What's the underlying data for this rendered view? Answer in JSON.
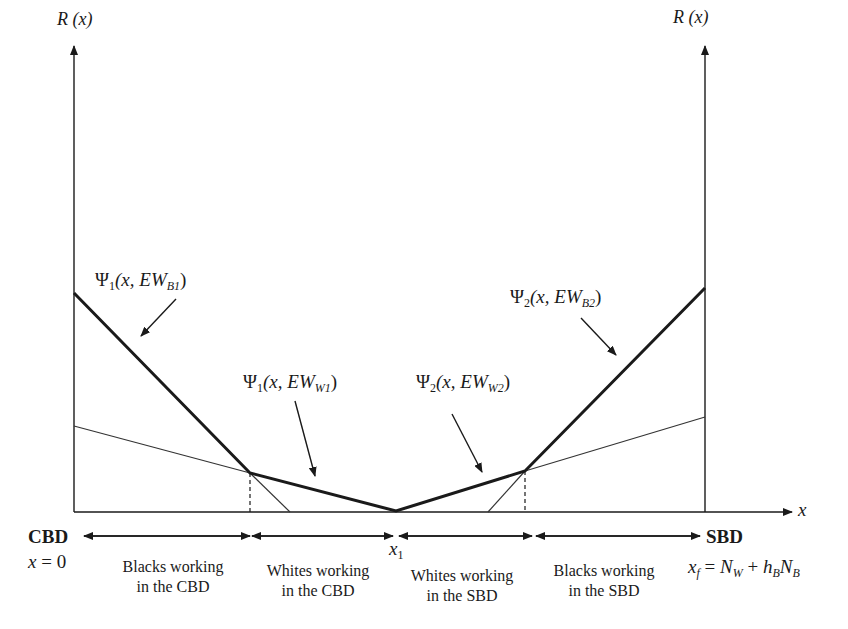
{
  "diagram": {
    "type": "bid-rent diagram",
    "axes": {
      "left_y_label": {
        "main": "R",
        "arg": "(x)"
      },
      "right_y_label": {
        "main": "R",
        "arg": "(x)"
      },
      "x_label": "x"
    },
    "curves": [
      {
        "id": "psi1_B1",
        "psi": "Ψ",
        "index": "1",
        "pre": "(x, EW",
        "sub": "B1",
        "post": ")",
        "style": "bold"
      },
      {
        "id": "psi1_W1",
        "psi": "Ψ",
        "index": "1",
        "pre": "(x, EW",
        "sub": "W1",
        "post": ")",
        "style": "bold"
      },
      {
        "id": "psi2_W2",
        "psi": "Ψ",
        "index": "2",
        "pre": "(x, EW",
        "sub": "W2",
        "post": ")",
        "style": "bold"
      },
      {
        "id": "psi2_B2",
        "psi": "Ψ",
        "index": "2",
        "pre": "(x, EW",
        "sub": "B2",
        "post": ")",
        "style": "bold"
      }
    ],
    "endpoints": {
      "left": {
        "name": "CBD",
        "eq_var": "x",
        "eq_rest": " = 0"
      },
      "middle": {
        "var": "x",
        "sub": "1"
      },
      "right": {
        "name": "SBD",
        "eq": {
          "x": "x",
          "xsub": "f",
          "eq": " = ",
          "n1": "N",
          "n1sub": "W",
          "plus": " + ",
          "h": "h",
          "hsub": "B",
          "n2": "N",
          "n2sub": "B"
        }
      }
    },
    "regions": [
      {
        "line1": "Blacks working",
        "line2": "in the CBD"
      },
      {
        "line1": "Whites working",
        "line2": "in the CBD"
      },
      {
        "line1": "Whites working",
        "line2": "in the SBD"
      },
      {
        "line1": "Blacks working",
        "line2": "in the SBD"
      }
    ],
    "colors": {
      "ink": "#1a1a1a",
      "background": "#ffffff"
    }
  }
}
